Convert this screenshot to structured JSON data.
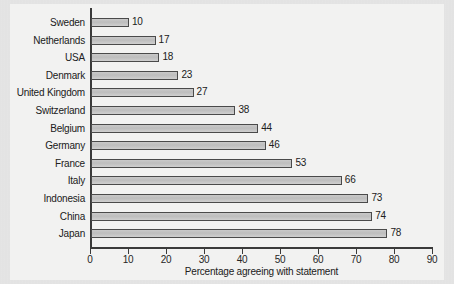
{
  "chart_data": {
    "type": "bar",
    "orientation": "horizontal",
    "title": "",
    "subtitle": "",
    "xlabel": "Percentage agreeing with statement",
    "ylabel": "",
    "xlim": [
      0,
      90
    ],
    "xticks": [
      0,
      10,
      20,
      30,
      40,
      50,
      60,
      70,
      80,
      90
    ],
    "grid": false,
    "legend": null,
    "categories": [
      "Sweden",
      "Netherlands",
      "USA",
      "Denmark",
      "United Kingdom",
      "Switzerland",
      "Belgium",
      "Germany",
      "France",
      "Italy",
      "Indonesia",
      "China",
      "Japan"
    ],
    "values": [
      10,
      17,
      18,
      23,
      27,
      38,
      44,
      46,
      53,
      66,
      73,
      74,
      78
    ],
    "data_labels": [
      "10",
      "17",
      "18",
      "23",
      "27",
      "38",
      "44",
      "46",
      "53",
      "66",
      "73",
      "74",
      "78"
    ],
    "colors": {
      "bar_fill": "#c4c4c4",
      "bar_border": "#4a4a4a",
      "axis": "#3a3a3a",
      "text": "#202020",
      "panel_background": "#f2f2f1",
      "page_background": "#e6e6e6"
    }
  }
}
